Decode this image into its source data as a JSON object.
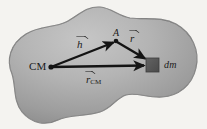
{
  "figure": {
    "background_color": "#f4f3f0",
    "body_fill_light": "#b9b9b9",
    "body_fill_dark": "#8e8e8e",
    "body_outline_color": "#6f6f6f",
    "vector_color": "#141414",
    "mass_element_color": "#555555"
  },
  "labels": {
    "center_of_mass": "CM",
    "point_a": "A",
    "mass_element": "dm"
  },
  "vectors": [
    {
      "id": "h",
      "symbol": "h",
      "subscript": "",
      "from": "CM",
      "to": "A",
      "label": "h"
    },
    {
      "id": "r",
      "symbol": "r",
      "subscript": "",
      "from": "A",
      "to": "dm",
      "label": "r"
    },
    {
      "id": "r_cm",
      "symbol": "r",
      "subscript": "CM",
      "from": "CM",
      "to": "dm",
      "label": "r_CM"
    }
  ],
  "points": {
    "cm": {
      "label": "CM",
      "x": 51,
      "y": 67
    },
    "a": {
      "label": "A",
      "x": 116,
      "y": 41
    },
    "dm": {
      "label": "dm",
      "x": 152,
      "y": 65
    }
  }
}
